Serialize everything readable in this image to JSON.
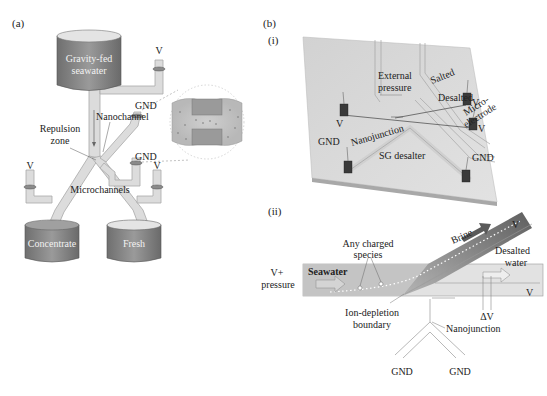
{
  "figure": {
    "panel_a": {
      "label": "(a)",
      "tank_top": {
        "line1": "Gravity-fed",
        "line2": "seawater"
      },
      "tank_left": "Concentrate",
      "tank_right": "Fresh",
      "labels": {
        "v_top": "V",
        "v_left": "V",
        "v_right": "V",
        "gnd_upper": "GND",
        "gnd_lower": "GND",
        "nanochannel": "Nanochannel",
        "repulsion_line1": "Repulsion",
        "repulsion_line2": "zone",
        "microchannels": "Microchannels"
      }
    },
    "panel_b": {
      "label": "(b)",
      "sub_i": {
        "label": "(i)",
        "ext_pressure_line1": "External",
        "ext_pressure_line2": "pressure",
        "salted": "Salted",
        "desalted": "Desalted",
        "nanojunction": "Nanojunction",
        "micro_line1": "Micro-",
        "micro_line2": "electrode",
        "v_left": "V",
        "v_right1": "V",
        "v_right2": "V",
        "gnd_left": "GND",
        "gnd_right": "GND",
        "device": "SG desalter"
      },
      "sub_ii": {
        "label": "(ii)",
        "brine": "Brine",
        "v_top": "V",
        "v_mid": "V",
        "desalted_line1": "Desalted",
        "desalted_line2": "water",
        "charged_line1": "Any charged",
        "charged_line2": "species",
        "vplus_line1": "V+",
        "vplus_line2": "pressure",
        "seawater": "Seawater",
        "delta_v": "ΔV",
        "boundary_line1": "Ion-depletion",
        "boundary_line2": "boundary",
        "nanojunction": "Nanojunction",
        "gnd_left": "GND",
        "gnd_right": "GND"
      }
    },
    "colors": {
      "tank": "#8a8a8a",
      "tank_top": "#d8d8d8",
      "channel": "#dcdcdc",
      "slab": "#d9d9d9",
      "brine": "#6e6e6e",
      "seawater": "#c4c4c4"
    }
  }
}
